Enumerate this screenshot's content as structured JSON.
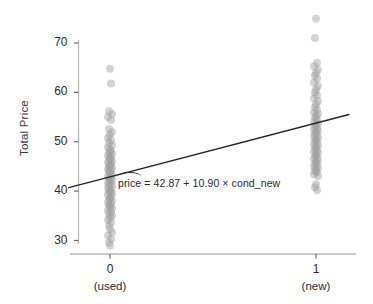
{
  "chart_data": {
    "type": "scatter",
    "title": "",
    "xlabel": "",
    "ylabel": "Total Price",
    "xlim": [
      -0.25,
      1.25
    ],
    "ylim": [
      27.5,
      72.5
    ],
    "grid": false,
    "legend_position": "none",
    "x_categories": [
      "0",
      "1"
    ],
    "x_category_sublabels": [
      "(used)",
      "(new)"
    ],
    "x_tick_values": [
      0,
      1
    ],
    "y_ticks": [
      30,
      40,
      50,
      60,
      70
    ],
    "y_tick_labels": [
      "30",
      "40",
      "50",
      "60",
      "70"
    ],
    "point_color": "#9e9e9e",
    "point_opacity": 0.45,
    "point_radius": 4.0,
    "line_color": "#262626",
    "axis_color": "#b8b8b8",
    "annotation": {
      "text_hat": "price",
      "text_rest": " = 42.87 + 10.90 × cond_new",
      "full_text": "pricê = 42.87 + 10.90 × cond_new"
    },
    "fit": {
      "intercept": 42.87,
      "slope": 10.9,
      "predictor": "cond_new",
      "response": "price",
      "x_start": -0.2,
      "x_end": 1.16
    },
    "series": [
      {
        "name": "cond_new = 0 (used)",
        "x": 0,
        "values": [
          64.8,
          61.8,
          56.2,
          55.6,
          55.0,
          54.4,
          52.6,
          52.0,
          51.4,
          50.8,
          50.3,
          49.8,
          49.3,
          48.9,
          48.5,
          48.1,
          47.8,
          47.5,
          47.2,
          46.9,
          46.6,
          46.3,
          46.0,
          45.8,
          45.5,
          45.2,
          45.0,
          44.7,
          44.4,
          44.1,
          43.9,
          43.6,
          43.3,
          43.0,
          42.8,
          42.5,
          42.2,
          42.0,
          41.7,
          41.4,
          41.1,
          40.9,
          40.6,
          40.3,
          40.0,
          39.8,
          39.5,
          39.2,
          38.9,
          38.6,
          38.3,
          38.0,
          37.7,
          37.4,
          37.1,
          36.8,
          36.5,
          36.1,
          35.8,
          35.4,
          35.0,
          34.6,
          34.2,
          33.6,
          33.0,
          32.3,
          31.6,
          31.0,
          30.3,
          29.6,
          29.0
        ],
        "jitter_px": [
          0,
          1,
          -1,
          2,
          -2,
          1,
          -1,
          2,
          0,
          -2,
          1,
          -1,
          2,
          -2,
          0,
          1,
          -1,
          2,
          -2,
          0,
          1,
          -1,
          2,
          -2,
          1,
          0,
          -1,
          2,
          -2,
          1,
          -1,
          0,
          2,
          -2,
          1,
          -1,
          2,
          0,
          -2,
          1,
          -1,
          2,
          -2,
          0,
          1,
          -1,
          2,
          -2,
          1,
          0,
          -1,
          2,
          -2,
          1,
          -1,
          0,
          2,
          -2,
          1,
          -1,
          2,
          0,
          -2,
          1,
          -1,
          0,
          2,
          -2,
          1,
          -1,
          0
        ]
      },
      {
        "name": "cond_new = 1 (new)",
        "x": 1,
        "values": [
          74.9,
          71.0,
          66.0,
          65.3,
          64.6,
          64.0,
          63.4,
          62.8,
          62.0,
          61.3,
          60.6,
          60.0,
          59.4,
          58.8,
          58.2,
          57.6,
          57.0,
          56.5,
          56.0,
          55.6,
          55.2,
          54.8,
          54.4,
          54.0,
          53.7,
          53.4,
          53.1,
          52.8,
          52.5,
          52.2,
          51.9,
          51.6,
          51.3,
          51.0,
          50.7,
          50.4,
          50.1,
          49.8,
          49.5,
          49.2,
          48.9,
          48.6,
          48.3,
          48.0,
          47.7,
          47.4,
          47.1,
          46.8,
          46.5,
          46.2,
          45.9,
          45.6,
          45.3,
          45.0,
          44.7,
          44.4,
          44.1,
          43.8,
          43.4,
          43.0,
          41.4,
          40.8,
          40.2
        ],
        "jitter_px": [
          0,
          -1,
          1,
          -2,
          2,
          0,
          -1,
          1,
          -2,
          2,
          0,
          -1,
          1,
          -2,
          2,
          0,
          -1,
          1,
          -2,
          2,
          0,
          -1,
          1,
          -2,
          2,
          0,
          -1,
          1,
          -2,
          2,
          0,
          -1,
          1,
          -2,
          2,
          0,
          -1,
          1,
          -2,
          2,
          0,
          -1,
          1,
          -2,
          2,
          0,
          -1,
          1,
          -2,
          2,
          0,
          -1,
          1,
          -2,
          2,
          0,
          -1,
          1,
          -2,
          2,
          0,
          -1,
          1
        ]
      }
    ]
  }
}
